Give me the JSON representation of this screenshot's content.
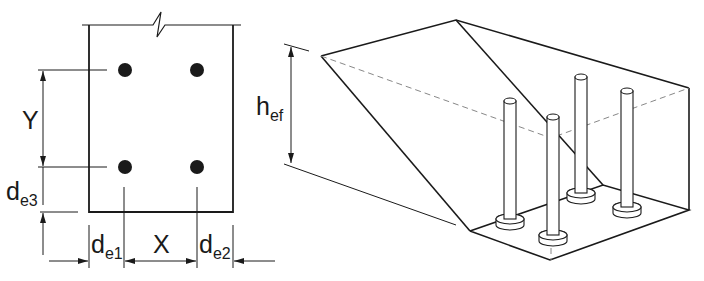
{
  "figure": {
    "type": "anchor group edge distance diagram",
    "plan_view": {
      "labels": {
        "y_spacing": "Y",
        "x_spacing": "X",
        "edge_dist_1": {
          "main": "d",
          "sub": "e1"
        },
        "edge_dist_2": {
          "main": "d",
          "sub": "e2"
        },
        "edge_dist_3": {
          "main": "d",
          "sub": "e3"
        }
      },
      "anchor_count": 4
    },
    "isometric_view": {
      "labels": {
        "embedment_depth": {
          "main": "h",
          "sub": "ef"
        }
      },
      "anchor_count": 4
    },
    "colors": {
      "line": "#1a1a1a",
      "dashed": "#888888",
      "background": "#ffffff"
    }
  }
}
